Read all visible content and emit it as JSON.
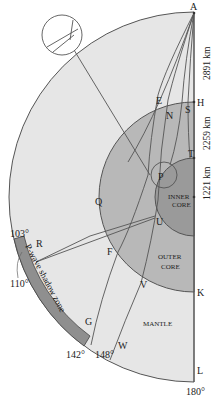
{
  "diagram": {
    "colors": {
      "mantle": "#e6e6e6",
      "outer_core": "#b8b8b8",
      "inner_core": "#9a9a9a",
      "shadow_zone": "#8f8f8f",
      "line": "#555555"
    },
    "point_labels": {
      "A": "A",
      "E": "E",
      "N": "N",
      "S": "S",
      "H": "H",
      "P": "P",
      "T": "T",
      "Q": "Q",
      "U": "U",
      "R": "R",
      "F": "F",
      "V": "V",
      "G": "G",
      "W": "W",
      "K": "K",
      "L": "L"
    },
    "regions": {
      "inner_core_line1": "INNER",
      "inner_core_line2": "CORE",
      "outer_core_line1": "OUTER",
      "outer_core_line2": "CORE",
      "mantle": "MANTLE"
    },
    "shadow_zone_label": "P-wave shadow zone",
    "angles": {
      "a103": "103°",
      "a110": "110°",
      "a142": "142°",
      "a148": "148°",
      "a180": "180°"
    },
    "depths": {
      "mantle_thickness": "2891 km",
      "outer_core_thickness": "2259 km",
      "inner_core_radius": "1221 km"
    }
  }
}
